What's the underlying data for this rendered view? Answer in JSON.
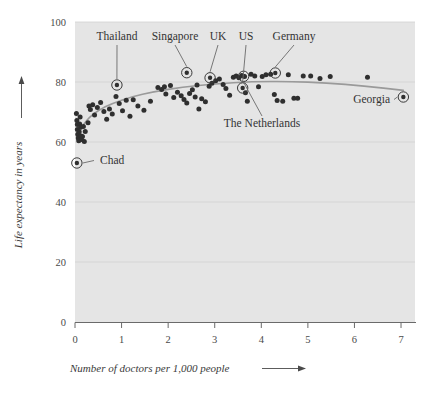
{
  "chart_data": {
    "type": "scatter",
    "title": "",
    "xlabel": "Number of doctors per 1,000 people",
    "ylabel": "Life expectancy in years",
    "xlim": [
      0,
      7.3
    ],
    "ylim": [
      0,
      100
    ],
    "xticks": [
      0,
      1,
      2,
      3,
      4,
      5,
      6,
      7
    ],
    "xtick_labels": [
      "0",
      "1",
      "2",
      "3",
      "4",
      "5",
      "6",
      "7"
    ],
    "yticks": [
      0,
      20,
      40,
      60,
      80,
      100
    ],
    "ytick_labels": [
      "0",
      "20",
      "40",
      "60",
      "80",
      "100"
    ],
    "grid": "faint-horizontal",
    "legend": "none",
    "plot_bg": "#e5e5e5",
    "point_color": "#2f2f2f",
    "trend_color": "#9a9a9a",
    "points": [
      [
        0.03,
        69.5
      ],
      [
        0.04,
        67.2
      ],
      [
        0.05,
        65.8
      ],
      [
        0.05,
        64.2
      ],
      [
        0.06,
        62.6
      ],
      [
        0.07,
        61.3
      ],
      [
        0.08,
        60.4
      ],
      [
        0.09,
        63.4
      ],
      [
        0.1,
        66.0
      ],
      [
        0.11,
        68.3
      ],
      [
        0.12,
        64.9
      ],
      [
        0.13,
        62.0
      ],
      [
        0.14,
        60.8
      ],
      [
        0.18,
        65.2
      ],
      [
        0.22,
        63.5
      ],
      [
        0.28,
        66.4
      ],
      [
        0.33,
        70.8
      ],
      [
        0.38,
        72.4
      ],
      [
        0.42,
        69.0
      ],
      [
        0.48,
        71.5
      ],
      [
        0.55,
        73.2
      ],
      [
        0.62,
        70.2
      ],
      [
        0.68,
        67.6
      ],
      [
        0.74,
        71.0
      ],
      [
        0.8,
        69.3
      ],
      [
        0.88,
        75.2
      ],
      [
        0.95,
        72.8
      ],
      [
        1.02,
        70.4
      ],
      [
        1.1,
        73.9
      ],
      [
        1.18,
        68.6
      ],
      [
        1.25,
        74.1
      ],
      [
        1.35,
        72.0
      ],
      [
        1.48,
        70.6
      ],
      [
        1.62,
        73.6
      ],
      [
        1.78,
        78.2
      ],
      [
        1.86,
        77.5
      ],
      [
        1.95,
        76.0
      ],
      [
        2.05,
        78.8
      ],
      [
        2.12,
        74.8
      ],
      [
        2.2,
        76.6
      ],
      [
        2.28,
        75.4
      ],
      [
        2.34,
        74.2
      ],
      [
        2.4,
        73.0
      ],
      [
        2.46,
        76.2
      ],
      [
        2.52,
        77.4
      ],
      [
        2.58,
        75.0
      ],
      [
        2.66,
        71.0
      ],
      [
        2.72,
        74.4
      ],
      [
        2.8,
        73.4
      ],
      [
        2.88,
        78.6
      ],
      [
        2.94,
        79.6
      ],
      [
        3.02,
        80.4
      ],
      [
        3.1,
        81.0
      ],
      [
        3.18,
        79.2
      ],
      [
        3.24,
        77.8
      ],
      [
        3.32,
        75.6
      ],
      [
        3.4,
        81.6
      ],
      [
        3.46,
        82.0
      ],
      [
        3.52,
        81.4
      ],
      [
        3.58,
        82.2
      ],
      [
        3.64,
        81.8
      ],
      [
        3.7,
        73.6
      ],
      [
        3.78,
        82.6
      ],
      [
        3.86,
        82.0
      ],
      [
        3.94,
        78.4
      ],
      [
        4.02,
        81.8
      ],
      [
        4.1,
        82.4
      ],
      [
        4.2,
        82.6
      ],
      [
        4.28,
        75.8
      ],
      [
        4.34,
        73.8
      ],
      [
        4.46,
        73.6
      ],
      [
        4.58,
        82.4
      ],
      [
        4.7,
        74.6
      ],
      [
        4.78,
        74.6
      ],
      [
        4.9,
        82.0
      ],
      [
        5.06,
        82.0
      ],
      [
        5.26,
        81.2
      ],
      [
        5.48,
        81.8
      ],
      [
        6.28,
        81.6
      ],
      [
        3.66,
        76.4
      ],
      [
        2.62,
        79.0
      ],
      [
        1.92,
        78.4
      ],
      [
        0.3,
        72.0
      ],
      [
        0.16,
        61.8
      ],
      [
        0.2,
        60.2
      ]
    ],
    "highlighted": [
      {
        "label": "Thailand",
        "x": 0.9,
        "y": 79.0,
        "label_x": 117,
        "label_y": 40,
        "anchor": "middle"
      },
      {
        "label": "Singapore",
        "x": 2.4,
        "y": 83.1,
        "label_x": 175,
        "label_y": 40,
        "anchor": "middle"
      },
      {
        "label": "UK",
        "x": 2.9,
        "y": 81.4,
        "label_x": 218,
        "label_y": 40,
        "anchor": "middle"
      },
      {
        "label": "US",
        "x": 3.6,
        "y": 78.0,
        "label_x": 246,
        "label_y": 40,
        "anchor": "middle"
      },
      {
        "label": "Germany",
        "x": 4.3,
        "y": 83.0,
        "label_x": 294,
        "label_y": 40,
        "anchor": "middle"
      },
      {
        "label": "The Netherlands",
        "x": 3.62,
        "y": 81.9,
        "label_x": 262,
        "label_y": 127,
        "anchor": "middle"
      },
      {
        "label": "Chad",
        "x": 0.04,
        "y": 53.0,
        "label_x": 100,
        "label_y": 164,
        "anchor": "start"
      },
      {
        "label": "Georgia",
        "x": 7.05,
        "y": 75.0,
        "label_x": 390,
        "label_y": 103,
        "anchor": "end"
      }
    ],
    "trend_points": [
      [
        0.03,
        62.0
      ],
      [
        0.25,
        67.5
      ],
      [
        0.5,
        70.6
      ],
      [
        0.8,
        72.9
      ],
      [
        1.2,
        75.0
      ],
      [
        1.7,
        76.8
      ],
      [
        2.3,
        78.3
      ],
      [
        3.0,
        79.4
      ],
      [
        3.8,
        80.1
      ],
      [
        4.6,
        80.2
      ],
      [
        5.4,
        79.7
      ],
      [
        6.2,
        78.7
      ],
      [
        7.05,
        77.2
      ]
    ]
  },
  "axis": {
    "y_arrow": "up-arrow",
    "x_arrow": "right-arrow"
  }
}
